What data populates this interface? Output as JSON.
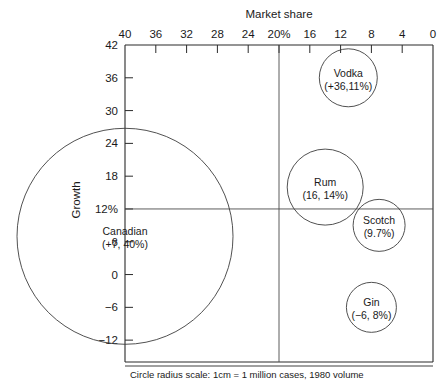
{
  "chart_data": {
    "type": "scatter",
    "title": "",
    "xlabel": "Market share",
    "ylabel": "Growth",
    "xlim": [
      40,
      0
    ],
    "ylim": [
      -16,
      42
    ],
    "x_reversed": true,
    "grid": false,
    "legend": "none",
    "xticks": [
      "40",
      "36",
      "32",
      "28",
      "24",
      "20%",
      "16",
      "12",
      "8",
      "4",
      "0"
    ],
    "xtick_values": [
      40,
      36,
      32,
      28,
      24,
      20,
      16,
      12,
      8,
      4,
      0
    ],
    "yticks": [
      "42",
      "36",
      "30",
      "24",
      "18",
      "12%",
      "6",
      "0",
      "−6",
      "−12"
    ],
    "ytick_values": [
      42,
      36,
      30,
      24,
      18,
      12,
      6,
      0,
      -6,
      -12
    ],
    "reference_lines": [
      {
        "axis": "x",
        "value": 20,
        "label": "20%"
      },
      {
        "axis": "y",
        "value": 12,
        "label": "12%"
      }
    ],
    "size_encoding": "Circle radius scale: 1cm = 1 million cases, 1980 volume",
    "points": [
      {
        "name": "Canadian",
        "label": "(+7, 40%)",
        "growth": 7,
        "market_share": 40,
        "radius_px": 108
      },
      {
        "name": "Vodka",
        "label": "(+36,11%)",
        "growth": 36,
        "market_share": 11,
        "radius_px": 29
      },
      {
        "name": "Rum",
        "label": "(16, 14%)",
        "growth": 16,
        "market_share": 14,
        "radius_px": 38
      },
      {
        "name": "Scotch",
        "label": "(9.7%)",
        "growth": 9,
        "market_share": 7,
        "radius_px": 26
      },
      {
        "name": "Gin",
        "label": "(−6, 8%)",
        "growth": -6,
        "market_share": 8,
        "radius_px": 25
      }
    ]
  },
  "caption": {
    "text": "Circle radius scale: 1cm = 1 million cases, 1980 volume"
  },
  "axes": {
    "x_title": "Market share",
    "y_title": "Growth"
  }
}
